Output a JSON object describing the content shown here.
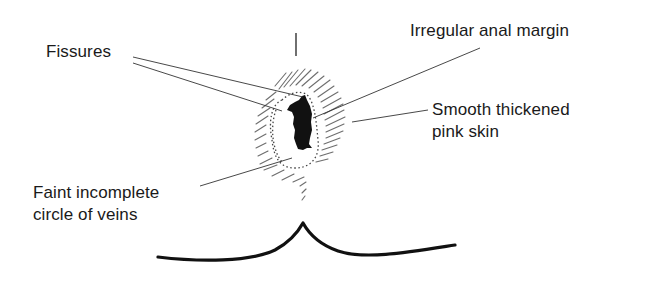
{
  "diagram": {
    "type": "annotated medical illustration",
    "labels": {
      "fissures": "Fissures",
      "irregular_margin": "Irregular anal margin",
      "smooth_skin_line1": "Smooth thickened",
      "smooth_skin_line2": "pink skin",
      "veins_line1": "Faint incomplete",
      "veins_line2": "circle of veins"
    },
    "colors": {
      "ink": "#111111",
      "hatching": "#555555",
      "background": "#ffffff"
    }
  }
}
